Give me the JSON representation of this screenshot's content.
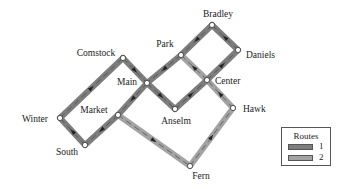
{
  "diagram": {
    "type": "transit-route-map",
    "stations": [
      {
        "id": "bradley",
        "label": "Bradley",
        "x": 212,
        "y": 25,
        "lx": 218,
        "ly": 17,
        "anchor": "middle"
      },
      {
        "id": "daniels",
        "label": "Daniels",
        "x": 238,
        "y": 50,
        "lx": 246,
        "ly": 58,
        "anchor": "start"
      },
      {
        "id": "park",
        "label": "Park",
        "x": 181,
        "y": 55,
        "lx": 165,
        "ly": 47,
        "anchor": "middle"
      },
      {
        "id": "comstock",
        "label": "Comstock",
        "x": 123,
        "y": 58,
        "lx": 96,
        "ly": 56,
        "anchor": "middle"
      },
      {
        "id": "main",
        "label": "Main",
        "x": 147,
        "y": 83,
        "lx": 127,
        "ly": 85,
        "anchor": "middle"
      },
      {
        "id": "center",
        "label": "Center",
        "x": 207,
        "y": 80,
        "lx": 215,
        "ly": 84,
        "anchor": "start"
      },
      {
        "id": "anselm",
        "label": "Anselm",
        "x": 175,
        "y": 109,
        "lx": 176,
        "ly": 124,
        "anchor": "middle"
      },
      {
        "id": "hawk",
        "label": "Hawk",
        "x": 233,
        "y": 108,
        "lx": 243,
        "ly": 112,
        "anchor": "start"
      },
      {
        "id": "winter",
        "label": "Winter",
        "x": 60,
        "y": 118,
        "lx": 35,
        "ly": 122,
        "anchor": "middle"
      },
      {
        "id": "market",
        "label": "Market",
        "x": 118,
        "y": 115,
        "lx": 94,
        "ly": 113,
        "anchor": "middle"
      },
      {
        "id": "south",
        "label": "South",
        "x": 85,
        "y": 145,
        "lx": 67,
        "ly": 155,
        "anchor": "middle"
      },
      {
        "id": "fern",
        "label": "Fern",
        "x": 190,
        "y": 166,
        "lx": 201,
        "ly": 179,
        "anchor": "middle"
      }
    ],
    "routes": [
      {
        "id": "1",
        "color": "#7d7d7d",
        "segments": [
          [
            "winter",
            "comstock"
          ],
          [
            "comstock",
            "main"
          ],
          [
            "main",
            "anselm"
          ],
          [
            "anselm",
            "center"
          ],
          [
            "center",
            "daniels"
          ],
          [
            "daniels",
            "bradley"
          ],
          [
            "bradley",
            "park"
          ],
          [
            "park",
            "main"
          ],
          [
            "main",
            "market"
          ],
          [
            "market",
            "south"
          ],
          [
            "south",
            "winter"
          ]
        ]
      },
      {
        "id": "2",
        "color": "#a3a3a3",
        "segments": [
          [
            "market",
            "fern"
          ],
          [
            "fern",
            "hawk"
          ],
          [
            "hawk",
            "center"
          ],
          [
            "center",
            "park"
          ]
        ]
      }
    ],
    "legend": {
      "title": "Routes",
      "items": [
        {
          "label": "1",
          "color": "#7d7d7d"
        },
        {
          "label": "2",
          "color": "#a3a3a3"
        }
      ]
    }
  }
}
